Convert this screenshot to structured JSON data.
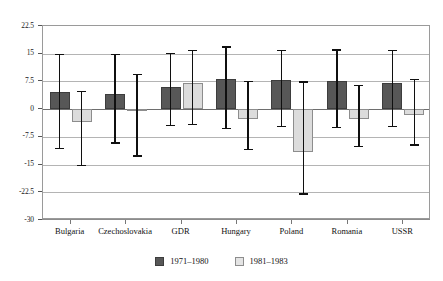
{
  "chart_data": {
    "type": "bar",
    "title": "",
    "subtitle": "",
    "xlabel": "",
    "ylabel": "",
    "categories": [
      "Bulgaria",
      "Czechoslovakia",
      "GDR",
      "Hungary",
      "Poland",
      "Romania",
      "USSR"
    ],
    "ylim": [
      -30,
      22.5
    ],
    "yticks": [
      22.5,
      15,
      7.5,
      0,
      -7.5,
      -15,
      -22.5,
      -30
    ],
    "ytick_labels": [
      "22.5",
      "15",
      "7.5",
      "0",
      "-7.5",
      "-15",
      "-22.5",
      "-30"
    ],
    "grid": true,
    "legend_position": "bottom-center",
    "error_bars": true,
    "series": [
      {
        "name": "1971-1980",
        "color": "#575757",
        "values": [
          4.6,
          4.2,
          6.0,
          8.2,
          8.0,
          7.6,
          7.2
        ],
        "err_low": [
          -10.5,
          -9.0,
          -4.2,
          -5.0,
          -4.6,
          -4.8,
          -4.6
        ],
        "err_high": [
          15.0,
          15.0,
          15.3,
          17.0,
          16.0,
          16.2,
          16.0
        ]
      },
      {
        "name": "1981-1983",
        "color": "#dcdcdc",
        "values": [
          -3.6,
          -0.3,
          7.0,
          -2.8,
          -11.5,
          -2.8,
          -1.5
        ],
        "err_low": [
          -15.0,
          -12.5,
          -4.0,
          -10.8,
          -22.8,
          -10.0,
          -9.5
        ],
        "err_high": [
          5.0,
          9.5,
          16.0,
          7.7,
          7.5,
          6.5,
          8.3
        ]
      }
    ]
  },
  "legend": {
    "items": [
      {
        "label": "1971–1980",
        "swatch": "dark-gray-swatch"
      },
      {
        "label": "1981–1983",
        "swatch": "light-gray-swatch"
      }
    ]
  }
}
